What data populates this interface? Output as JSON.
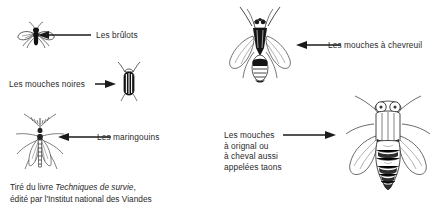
{
  "figure": {
    "type": "labelled-illustration",
    "background_color": "#ffffff",
    "ink_color": "#1a1a1a"
  },
  "labels": {
    "brulots": "Les brûlots",
    "mouches_noires": "Les mouches noires",
    "maringouins": "Les maringouins",
    "mouches_chevreuil": "Les mouches à chevreuil",
    "taons_line1": "Les mouches",
    "taons_line2": "à orignal ou",
    "taons_line3": "à cheval aussi",
    "taons_line4": "appelées taons"
  },
  "caption": {
    "line1_prefix": "Tiré du livre ",
    "line1_title": "Techniques de survie",
    "line1_suffix": ",",
    "line2": "édité par l'Institut national des Viandes"
  },
  "arrows": {
    "brulots_direction": "left",
    "mouches_noires_direction": "right",
    "maringouins_direction": "left",
    "mouches_chevreuil_direction": "left",
    "taons_direction": "right"
  },
  "illustrations": {
    "brulots": "biting-midge-icon",
    "mouches_noires": "black-fly-icon",
    "maringouins": "mosquito-icon",
    "mouches_chevreuil": "deer-fly-icon",
    "taons": "horse-fly-icon"
  }
}
